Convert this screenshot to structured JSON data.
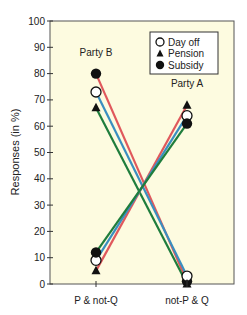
{
  "chart_data": {
    "type": "line",
    "title": "",
    "xlabel": "",
    "ylabel": "Responses (in %)",
    "ylim": [
      0,
      100
    ],
    "yticks": [
      0,
      10,
      20,
      30,
      40,
      50,
      60,
      70,
      80,
      90,
      100
    ],
    "categories": [
      "P & not-Q",
      "not-P & Q"
    ],
    "grid": false,
    "background": "#fdfbe0",
    "legend": {
      "placement": "top-right",
      "entries": [
        {
          "name": "Day off",
          "marker": "open-circle"
        },
        {
          "name": "Pension",
          "marker": "filled-triangle"
        },
        {
          "name": "Subsidy",
          "marker": "filled-circle"
        }
      ]
    },
    "annotations": [
      {
        "text": "Party B",
        "category": "P & not-Q",
        "y": 88
      },
      {
        "text": "Party A",
        "category": "not-P & Q",
        "y": 76
      }
    ],
    "series": [
      {
        "name": "Party B – Subsidy",
        "scenario": "Subsidy",
        "party": "B",
        "color": "#e0585c",
        "marker": "filled-circle",
        "values": [
          80,
          1
        ]
      },
      {
        "name": "Party B – Day off",
        "scenario": "Day off",
        "party": "B",
        "color": "#3a8fc0",
        "marker": "open-circle",
        "values": [
          73,
          3
        ]
      },
      {
        "name": "Party B – Pension",
        "scenario": "Pension",
        "party": "B",
        "color": "#1f7d3c",
        "marker": "filled-triangle",
        "values": [
          67,
          0
        ]
      },
      {
        "name": "Party A – Pension",
        "scenario": "Pension",
        "party": "A",
        "color": "#e0585c",
        "marker": "filled-triangle",
        "values": [
          5,
          68
        ]
      },
      {
        "name": "Party A – Day off",
        "scenario": "Day off",
        "party": "A",
        "color": "#3a8fc0",
        "marker": "open-circle",
        "values": [
          9,
          64
        ]
      },
      {
        "name": "Party A – Subsidy",
        "scenario": "Subsidy",
        "party": "A",
        "color": "#1f7d3c",
        "marker": "filled-circle",
        "values": [
          12,
          61
        ]
      }
    ]
  }
}
